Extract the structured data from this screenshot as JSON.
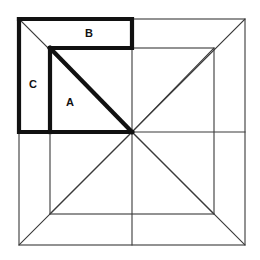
{
  "figure": {
    "background_color": "#ffffff",
    "thin_line_color": "#3a3a3a",
    "bold_line_color": "#111111",
    "outer_square": {
      "left": 19,
      "top": 19,
      "right": 245,
      "bottom": 245
    },
    "inner_square": {
      "left": 50,
      "top": 48,
      "right": 214,
      "bottom": 214
    },
    "center_point": {
      "x": 132,
      "y": 132
    },
    "labels": [
      {
        "id": "label-a",
        "text": "A",
        "x": 70,
        "y": 103
      },
      {
        "id": "label-b",
        "text": "B",
        "x": 89,
        "y": 34
      },
      {
        "id": "label-c",
        "text": "C",
        "x": 33,
        "y": 85
      }
    ],
    "bold_region": {
      "name": "highlighted-dissection",
      "description": "Bold outlined region in upper-left comprising triangle A, rectangle B and rectangle C",
      "rect_b_outline": "19,19 132,19 132,48 19,48",
      "rect_c_outline": "19,19 50,48 50,132 19,132",
      "triangle_a_outline": "50,48 132,132 50,132"
    }
  }
}
